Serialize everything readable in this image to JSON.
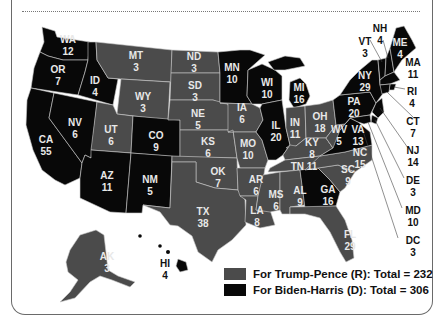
{
  "colors": {
    "republican": "#4b4b4b",
    "democrat": "#080808",
    "border": "#c9c9c9"
  },
  "legend": [
    {
      "label": "For Trump-Pence (R): Total = 232",
      "party": "R",
      "color": "#4b4b4b"
    },
    {
      "label": "For Biden-Harris (D): Total = 306",
      "party": "D",
      "color": "#080808"
    }
  ],
  "states": {
    "WA": {
      "abbr": "WA",
      "votes": "12",
      "party": "D"
    },
    "OR": {
      "abbr": "OR",
      "votes": "7",
      "party": "D"
    },
    "CA": {
      "abbr": "CA",
      "votes": "55",
      "party": "D"
    },
    "NV": {
      "abbr": "NV",
      "votes": "6",
      "party": "D"
    },
    "ID": {
      "abbr": "ID",
      "votes": "4",
      "party": "R"
    },
    "MT": {
      "abbr": "MT",
      "votes": "3",
      "party": "R"
    },
    "WY": {
      "abbr": "WY",
      "votes": "3",
      "party": "R"
    },
    "UT": {
      "abbr": "UT",
      "votes": "6",
      "party": "R"
    },
    "AZ": {
      "abbr": "AZ",
      "votes": "11",
      "party": "D"
    },
    "CO": {
      "abbr": "CO",
      "votes": "9",
      "party": "D"
    },
    "NM": {
      "abbr": "NM",
      "votes": "5",
      "party": "D"
    },
    "ND": {
      "abbr": "ND",
      "votes": "3",
      "party": "R"
    },
    "SD": {
      "abbr": "SD",
      "votes": "3",
      "party": "R"
    },
    "NE": {
      "abbr": "NE",
      "votes": "5",
      "party": "R"
    },
    "KS": {
      "abbr": "KS",
      "votes": "6",
      "party": "R"
    },
    "OK": {
      "abbr": "OK",
      "votes": "7",
      "party": "R"
    },
    "TX": {
      "abbr": "TX",
      "votes": "38",
      "party": "R"
    },
    "MN": {
      "abbr": "MN",
      "votes": "10",
      "party": "D"
    },
    "IA": {
      "abbr": "IA",
      "votes": "6",
      "party": "R"
    },
    "MO": {
      "abbr": "MO",
      "votes": "10",
      "party": "R"
    },
    "AR": {
      "abbr": "AR",
      "votes": "6",
      "party": "R"
    },
    "LA": {
      "abbr": "LA",
      "votes": "8",
      "party": "R"
    },
    "WI": {
      "abbr": "WI",
      "votes": "10",
      "party": "D"
    },
    "IL": {
      "abbr": "IL",
      "votes": "20",
      "party": "D"
    },
    "MI": {
      "abbr": "MI",
      "votes": "16",
      "party": "D"
    },
    "IN": {
      "abbr": "IN",
      "votes": "11",
      "party": "R"
    },
    "OH": {
      "abbr": "OH",
      "votes": "18",
      "party": "R"
    },
    "KY": {
      "abbr": "KY",
      "votes": "8",
      "party": "R"
    },
    "TN": {
      "abbr": "TN",
      "votes": "11",
      "party": "R"
    },
    "MS": {
      "abbr": "MS",
      "votes": "6",
      "party": "R"
    },
    "AL": {
      "abbr": "AL",
      "votes": "9",
      "party": "R"
    },
    "GA": {
      "abbr": "GA",
      "votes": "16",
      "party": "D"
    },
    "FL": {
      "abbr": "FL",
      "votes": "29",
      "party": "R"
    },
    "SC": {
      "abbr": "SC",
      "votes": "9",
      "party": "R"
    },
    "NC": {
      "abbr": "NC",
      "votes": "15",
      "party": "R"
    },
    "VA": {
      "abbr": "VA",
      "votes": "13",
      "party": "D"
    },
    "WV": {
      "abbr": "WV",
      "votes": "5",
      "party": "R"
    },
    "PA": {
      "abbr": "PA",
      "votes": "20",
      "party": "D"
    },
    "NY": {
      "abbr": "NY",
      "votes": "29",
      "party": "D"
    },
    "VT": {
      "abbr": "VT",
      "votes": "3",
      "party": "D"
    },
    "NH": {
      "abbr": "NH",
      "votes": "4",
      "party": "D"
    },
    "ME": {
      "abbr": "ME",
      "votes": "4",
      "party": "D"
    },
    "MA": {
      "abbr": "MA",
      "votes": "11",
      "party": "D"
    },
    "RI": {
      "abbr": "RI",
      "votes": "4",
      "party": "D"
    },
    "CT": {
      "abbr": "CT",
      "votes": "7",
      "party": "D"
    },
    "NJ": {
      "abbr": "NJ",
      "votes": "14",
      "party": "D"
    },
    "DE": {
      "abbr": "DE",
      "votes": "3",
      "party": "D"
    },
    "MD": {
      "abbr": "MD",
      "votes": "10",
      "party": "D"
    },
    "DC": {
      "abbr": "DC",
      "votes": "3",
      "party": "D"
    },
    "AK": {
      "abbr": "AK",
      "votes": "3",
      "party": "R"
    },
    "HI": {
      "abbr": "HI",
      "votes": "4",
      "party": "D"
    }
  }
}
